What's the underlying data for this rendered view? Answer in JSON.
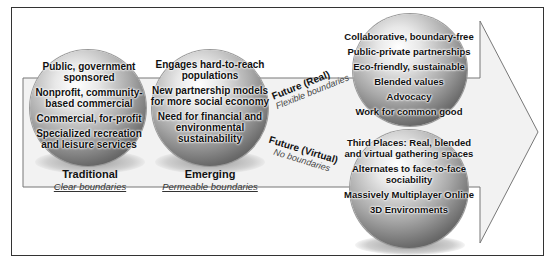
{
  "stages": [
    {
      "title": "Traditional",
      "subtitle": "Clear boundaries",
      "items": [
        "Public, government sponsored",
        "Nonprofit, community-based commercial",
        "Commercial, for-profit",
        "Specialized recreation and leisure services"
      ]
    },
    {
      "title": "Emerging",
      "subtitle": "Permeable boundaries",
      "items": [
        "Engages hard-to-reach populations",
        "New partnership models for more social economy",
        "Need for financial and environmental sustainability"
      ]
    }
  ],
  "futures": [
    {
      "title": "Future (Real)",
      "subtitle": "Flexible boundaries",
      "items": [
        "Collaborative, boundary-free",
        "Public-private partnerships",
        "Eco-friendly, sustainable",
        "Blended values",
        "Advocacy",
        "Work for common good"
      ]
    },
    {
      "title": "Future (Virtual)",
      "subtitle": "No boundaries",
      "items": [
        "Third Places: Real, blended and virtual gathering spaces",
        "Alternates to face-to-face sociability",
        "Massively Multiplayer Online",
        "3D Environments"
      ]
    }
  ],
  "colors": {
    "arrow_fill": "#f2f2f2",
    "arrow_stroke": "#777777",
    "frame": "#333333"
  }
}
